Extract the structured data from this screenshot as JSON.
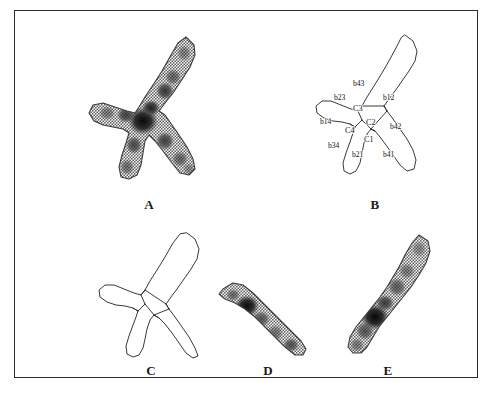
{
  "figure": {
    "background_color": "#ffffff",
    "frame_color": "#2b2b2b",
    "ink_color": "#232323",
    "panel_count": 5,
    "description_type": "chromosome-segmentation-figure"
  },
  "panels": [
    {
      "id": "A",
      "letter": "A",
      "kind": "grayscale-image",
      "caption": "A",
      "content_name": "overlapping-chromosome-grayscale"
    },
    {
      "id": "B",
      "letter": "B",
      "kind": "outline-with-labels",
      "caption": "B",
      "content_name": "chromosome-outline-with-cut-points"
    },
    {
      "id": "C",
      "letter": "C",
      "kind": "outline-segmented",
      "caption": "C",
      "content_name": "chromosome-outline-segmented"
    },
    {
      "id": "D",
      "letter": "D",
      "kind": "grayscale-image",
      "caption": "D",
      "content_name": "separated-chromosome-one"
    },
    {
      "id": "E",
      "letter": "E",
      "kind": "grayscale-image",
      "caption": "E",
      "content_name": "separated-chromosome-two"
    }
  ],
  "panel_b_labels": {
    "cut_points": [
      {
        "id": "b43",
        "text": "b43",
        "x": 52,
        "y": 57
      },
      {
        "id": "b12",
        "text": "b12",
        "x": 82,
        "y": 71
      },
      {
        "id": "b23",
        "text": "b23",
        "x": 33,
        "y": 71
      },
      {
        "id": "b14",
        "text": "b14",
        "x": 19,
        "y": 95
      },
      {
        "id": "b42",
        "text": "b42",
        "x": 89,
        "y": 100
      },
      {
        "id": "b34",
        "text": "b34",
        "x": 27,
        "y": 119
      },
      {
        "id": "b21",
        "text": "b21",
        "x": 51,
        "y": 128
      },
      {
        "id": "b41",
        "text": "b41",
        "x": 82,
        "y": 128
      }
    ],
    "regions": [
      {
        "id": "C3",
        "text": "C3",
        "x": 52,
        "y": 82
      },
      {
        "id": "C2",
        "text": "C2",
        "x": 65,
        "y": 96
      },
      {
        "id": "C4",
        "text": "C4",
        "x": 44,
        "y": 104
      },
      {
        "id": "C1",
        "text": "C1",
        "x": 63,
        "y": 113
      }
    ]
  }
}
